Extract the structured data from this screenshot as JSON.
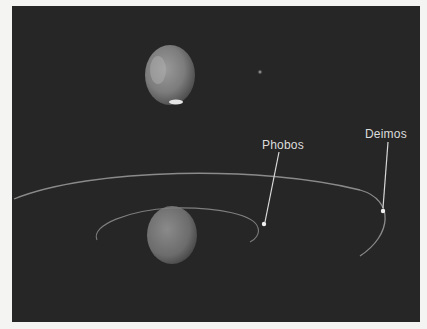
{
  "figure": {
    "labels": {
      "phobos": "Phobos",
      "deimos": "Deimos"
    },
    "elements": {
      "mars_top": "Mars (upper view, polar cap visible)",
      "mars_bottom": "Mars (orbit plane view)",
      "star": "small bright point"
    },
    "colors": {
      "background": "#262626",
      "page": "#f4f4f2",
      "orbit": "#8a8a8a",
      "label": "#dcdcdc"
    }
  }
}
